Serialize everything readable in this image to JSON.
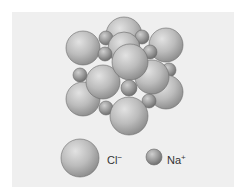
{
  "diagram": {
    "background_color": "#efefef",
    "sphere_color": "#b4b4b4",
    "ions": [
      {
        "type": "Cl",
        "x": 124,
        "y": 35,
        "r": 18
      },
      {
        "type": "Na",
        "x": 106,
        "y": 38,
        "r": 7
      },
      {
        "type": "Na",
        "x": 142,
        "y": 37,
        "r": 7
      },
      {
        "type": "Cl",
        "x": 83,
        "y": 48,
        "r": 17
      },
      {
        "type": "Cl",
        "x": 166,
        "y": 45,
        "r": 17
      },
      {
        "type": "Cl",
        "x": 124,
        "y": 48,
        "r": 16
      },
      {
        "type": "Na",
        "x": 105,
        "y": 54,
        "r": 7
      },
      {
        "type": "Na",
        "x": 150,
        "y": 52,
        "r": 7
      },
      {
        "type": "Na",
        "x": 80,
        "y": 75,
        "r": 7
      },
      {
        "type": "Na",
        "x": 169,
        "y": 70,
        "r": 7
      },
      {
        "type": "Cl",
        "x": 83,
        "y": 99,
        "r": 17
      },
      {
        "type": "Cl",
        "x": 166,
        "y": 92,
        "r": 17
      },
      {
        "type": "Cl",
        "x": 103,
        "y": 82,
        "r": 17
      },
      {
        "type": "Cl",
        "x": 152,
        "y": 77,
        "r": 17
      },
      {
        "type": "Cl",
        "x": 130,
        "y": 62,
        "r": 18
      },
      {
        "type": "Na",
        "x": 129,
        "y": 88,
        "r": 8
      },
      {
        "type": "Na",
        "x": 106,
        "y": 108,
        "r": 7
      },
      {
        "type": "Na",
        "x": 149,
        "y": 101,
        "r": 7
      },
      {
        "type": "Cl",
        "x": 129,
        "y": 116,
        "r": 19
      }
    ]
  },
  "legend": {
    "items": [
      {
        "symbol": "Cl",
        "charge": "−",
        "label": "Cl−",
        "x": 80,
        "y": 158,
        "r": 19
      },
      {
        "symbol": "Na",
        "charge": "+",
        "label": "Na+",
        "x": 154,
        "y": 157,
        "r": 8
      }
    ]
  }
}
